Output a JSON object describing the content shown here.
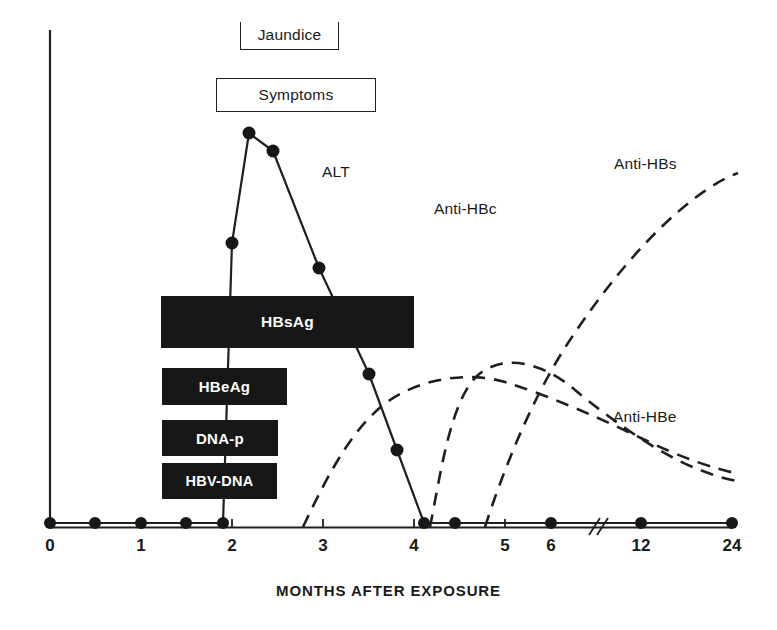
{
  "chart_data": {
    "type": "line",
    "title": "",
    "subtitle": "",
    "xlabel": "MONTHS AFTER EXPOSURE",
    "ylabel": "",
    "xlim": [
      0,
      24
    ],
    "ylim": [
      0,
      100
    ],
    "grid": false,
    "legend_position": "inline-annotations",
    "x_tick_labels": [
      "0",
      "1",
      "2",
      "3",
      "4",
      "5",
      "6",
      "12",
      "24"
    ],
    "x_tick_values": [
      0,
      1,
      2,
      3,
      4,
      5,
      6,
      12,
      24
    ],
    "axis_break_between": [
      6,
      12
    ],
    "y_axis_visible": true,
    "y_tick_labels": [],
    "series": [
      {
        "name": "ALT",
        "style": "solid-with-markers",
        "color": "#171717",
        "points": [
          {
            "x": 0.0,
            "y": 2
          },
          {
            "x": 0.5,
            "y": 2
          },
          {
            "x": 1.0,
            "y": 2
          },
          {
            "x": 1.5,
            "y": 2
          },
          {
            "x": 1.95,
            "y": 2
          },
          {
            "x": 2.3,
            "y": 37
          },
          {
            "x": 2.7,
            "y": 79
          },
          {
            "x": 3.0,
            "y": 73
          },
          {
            "x": 3.55,
            "y": 51
          },
          {
            "x": 4.15,
            "y": 30
          },
          {
            "x": 4.45,
            "y": 14
          },
          {
            "x": 4.72,
            "y": 2
          },
          {
            "x": 5.0,
            "y": 2
          },
          {
            "x": 6.0,
            "y": 2
          },
          {
            "x": 12.0,
            "y": 2
          },
          {
            "x": 24.0,
            "y": 2
          }
        ]
      },
      {
        "name": "Anti-HBc",
        "style": "dashed",
        "color": "#1f1f1f",
        "points": [
          {
            "x": 3.35,
            "y": 0
          },
          {
            "x": 3.8,
            "y": 26
          },
          {
            "x": 4.3,
            "y": 43
          },
          {
            "x": 4.9,
            "y": 49
          },
          {
            "x": 5.6,
            "y": 47
          },
          {
            "x": 8.0,
            "y": 39
          },
          {
            "x": 14.0,
            "y": 26
          },
          {
            "x": 24.0,
            "y": 20
          }
        ]
      },
      {
        "name": "Anti-HBe",
        "style": "dashed",
        "color": "#1f1f1f",
        "points": [
          {
            "x": 4.18,
            "y": 0
          },
          {
            "x": 4.6,
            "y": 18
          },
          {
            "x": 5.1,
            "y": 29
          },
          {
            "x": 5.8,
            "y": 27
          },
          {
            "x": 8.0,
            "y": 20
          },
          {
            "x": 14.0,
            "y": 12
          },
          {
            "x": 24.0,
            "y": 9
          }
        ]
      },
      {
        "name": "Anti-HBs",
        "style": "dashed",
        "color": "#1f1f1f",
        "points": [
          {
            "x": 5.42,
            "y": 0
          },
          {
            "x": 6.2,
            "y": 17
          },
          {
            "x": 8.0,
            "y": 34
          },
          {
            "x": 12.0,
            "y": 52
          },
          {
            "x": 17.0,
            "y": 64
          },
          {
            "x": 24.0,
            "y": 70
          }
        ]
      }
    ],
    "marker_bars": [
      {
        "name": "HBsAg",
        "label": "HBsAg",
        "start_month": 1.92,
        "end_month": 5.05,
        "row": 1
      },
      {
        "name": "HBeAg",
        "label": "HBeAg",
        "start_month": 1.93,
        "end_month": 3.5,
        "row": 2
      },
      {
        "name": "DNA-p",
        "label": "DNA-p",
        "start_month": 1.93,
        "end_month": 3.38,
        "row": 3
      },
      {
        "name": "HBV-DNA",
        "label": "HBV-DNA",
        "start_month": 1.93,
        "end_month": 3.37,
        "row": 4
      }
    ],
    "event_boxes": [
      {
        "name": "jaundice",
        "label": "Jaundice",
        "border": "open-top"
      },
      {
        "name": "symptoms",
        "label": "Symptoms",
        "border": "full"
      }
    ],
    "annotations": [
      {
        "name": "alt",
        "label": "ALT"
      },
      {
        "name": "anti-hbc",
        "label": "Anti-HBc"
      },
      {
        "name": "anti-hbs",
        "label": "Anti-HBs"
      },
      {
        "name": "anti-hbe",
        "label": "Anti-HBe"
      }
    ]
  },
  "boxes": {
    "jaundice": "Jaundice",
    "symptoms": "Symptoms"
  },
  "bars": {
    "hbsag": "HBsAg",
    "hbeag": "HBeAg",
    "dnap": "DNA-p",
    "hbvdna": "HBV-DNA"
  },
  "labels": {
    "alt": "ALT",
    "anti_hbc": "Anti-HBc",
    "anti_hbs": "Anti-HBs",
    "anti_hbe": "Anti-HBe"
  },
  "axis": {
    "title": "MONTHS AFTER EXPOSURE",
    "ticks": [
      "0",
      "1",
      "2",
      "3",
      "4",
      "5",
      "6",
      "12",
      "24"
    ]
  }
}
